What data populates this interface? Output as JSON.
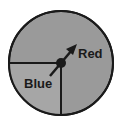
{
  "diagram": {
    "type": "spinner",
    "sections": [
      {
        "label": "Red",
        "fraction": 0.75,
        "color": "#9a9a9a"
      },
      {
        "label": "Blue",
        "fraction": 0.25,
        "color": "#a6a6a6"
      }
    ],
    "pointer": {
      "direction": "up-right",
      "points_to": "Red"
    },
    "outline_color": "#1a1a1a"
  }
}
